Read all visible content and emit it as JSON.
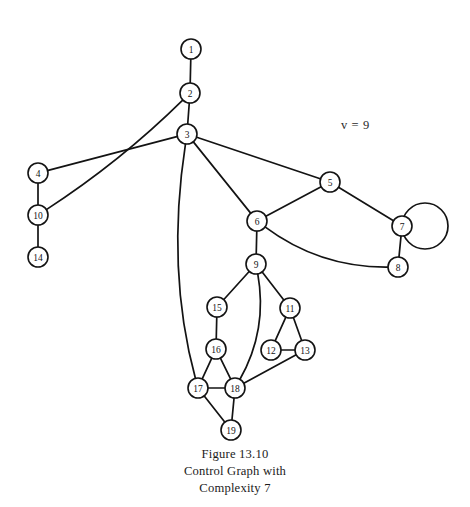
{
  "figure": {
    "annotation": "v = 9",
    "annotation_x": 341,
    "annotation_y": 129,
    "caption_lines": [
      "Figure 13.10",
      "Control Graph with",
      "Complexity 7"
    ],
    "background_color": "#ffffff",
    "ink_color": "#131313"
  },
  "chart_data": {
    "type": "diagram",
    "title": "Figure 13.10",
    "subtitle": "Control Graph with Complexity 7",
    "annotations": [
      {
        "text": "v = 9",
        "x": 341,
        "y": 129
      }
    ],
    "node_radius": 10,
    "nodes": [
      {
        "id": 1,
        "label": "1",
        "x": 191,
        "y": 49
      },
      {
        "id": 2,
        "label": "2",
        "x": 190,
        "y": 93
      },
      {
        "id": 3,
        "label": "3",
        "x": 187,
        "y": 134
      },
      {
        "id": 4,
        "label": "4",
        "x": 38,
        "y": 173
      },
      {
        "id": 5,
        "label": "5",
        "x": 330,
        "y": 182
      },
      {
        "id": 6,
        "label": "6",
        "x": 257,
        "y": 221
      },
      {
        "id": 7,
        "label": "7",
        "x": 402,
        "y": 226
      },
      {
        "id": 8,
        "label": "8",
        "x": 398,
        "y": 267
      },
      {
        "id": 9,
        "label": "9",
        "x": 256,
        "y": 264
      },
      {
        "id": 10,
        "label": "10",
        "x": 38,
        "y": 215
      },
      {
        "id": 11,
        "label": "11",
        "x": 290,
        "y": 308
      },
      {
        "id": 12,
        "label": "12",
        "x": 271,
        "y": 350
      },
      {
        "id": 13,
        "label": "13",
        "x": 305,
        "y": 350
      },
      {
        "id": 14,
        "label": "14",
        "x": 38,
        "y": 257
      },
      {
        "id": 15,
        "label": "15",
        "x": 217,
        "y": 307
      },
      {
        "id": 16,
        "label": "16",
        "x": 216,
        "y": 349
      },
      {
        "id": 17,
        "label": "17",
        "x": 198,
        "y": 388
      },
      {
        "id": 18,
        "label": "18",
        "x": 235,
        "y": 388
      },
      {
        "id": 19,
        "label": "19",
        "x": 231,
        "y": 430
      }
    ],
    "edges": [
      {
        "from": 1,
        "to": 2,
        "curve": null
      },
      {
        "from": 2,
        "to": 3,
        "curve": null
      },
      {
        "from": 2,
        "to": 10,
        "curve": [
          120,
          162
        ]
      },
      {
        "from": 3,
        "to": 4,
        "curve": null
      },
      {
        "from": 3,
        "to": 5,
        "curve": null
      },
      {
        "from": 3,
        "to": 6,
        "curve": null
      },
      {
        "from": 3,
        "to": 17,
        "curve": [
          166,
          270
        ]
      },
      {
        "from": 4,
        "to": 10,
        "curve": null
      },
      {
        "from": 10,
        "to": 14,
        "curve": null
      },
      {
        "from": 5,
        "to": 6,
        "curve": null
      },
      {
        "from": 5,
        "to": 7,
        "curve": null
      },
      {
        "from": 6,
        "to": 8,
        "curve": [
          320,
          268
        ]
      },
      {
        "from": 6,
        "to": 9,
        "curve": null
      },
      {
        "from": 7,
        "to": 8,
        "curve": null
      },
      {
        "from": 9,
        "to": 11,
        "curve": null
      },
      {
        "from": 9,
        "to": 15,
        "curve": null
      },
      {
        "from": 9,
        "to": 18,
        "curve": [
          268,
          330
        ]
      },
      {
        "from": 11,
        "to": 12,
        "curve": null
      },
      {
        "from": 11,
        "to": 13,
        "curve": null
      },
      {
        "from": 12,
        "to": 13,
        "curve": null
      },
      {
        "from": 13,
        "to": 18,
        "curve": null
      },
      {
        "from": 15,
        "to": 16,
        "curve": null
      },
      {
        "from": 16,
        "to": 17,
        "curve": null
      },
      {
        "from": 16,
        "to": 18,
        "curve": null
      },
      {
        "from": 17,
        "to": 18,
        "curve": null
      },
      {
        "from": 17,
        "to": 19,
        "curve": null
      },
      {
        "from": 18,
        "to": 19,
        "curve": null
      }
    ],
    "self_loops": [
      {
        "node": 7,
        "cx": 425,
        "cy": 226,
        "r": 23
      }
    ]
  }
}
